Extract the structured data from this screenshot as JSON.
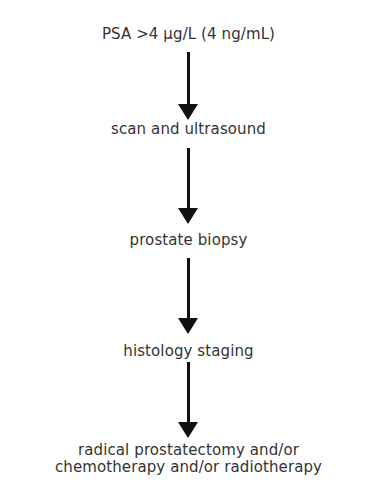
{
  "flowchart": {
    "steps": [
      {
        "label": "PSA >4 µg/L (4 ng/mL)"
      },
      {
        "label": "scan and ultrasound"
      },
      {
        "label": "prostate biopsy"
      },
      {
        "label": "histology staging"
      },
      {
        "label": "radical prostatectomy and/or",
        "label2": "chemotherapy and/or radiotherapy"
      }
    ],
    "colors": {
      "text": "#333333",
      "arrow": "#111111",
      "background": "#ffffff"
    }
  }
}
